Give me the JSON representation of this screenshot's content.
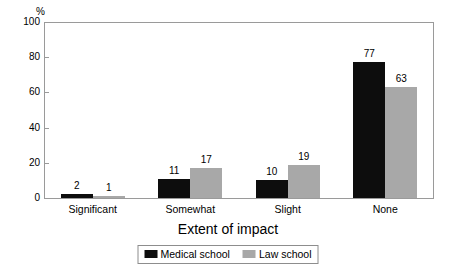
{
  "chart_data": {
    "type": "bar",
    "title": "",
    "subtitle": "",
    "xlabel": "Extent of impact",
    "ylabel": "%",
    "ylim": [
      0,
      100
    ],
    "yticks": [
      0,
      20,
      40,
      60,
      80,
      100
    ],
    "ytick_labels": [
      "0",
      "20",
      "40",
      "60",
      "80",
      "100"
    ],
    "grid": false,
    "legend_position": "bottom-center",
    "categories": [
      "Significant",
      "Somewhat",
      "Slight",
      "None"
    ],
    "series": [
      {
        "name": "Medical school",
        "color": "#0d0d0d",
        "values": [
          2,
          11,
          10,
          77
        ],
        "value_labels": [
          "2",
          "11",
          "10",
          "77"
        ]
      },
      {
        "name": "Law school",
        "color": "#a8a8a8",
        "values": [
          1,
          17,
          19,
          63
        ],
        "value_labels": [
          "1",
          "17",
          "19",
          "63"
        ]
      }
    ]
  },
  "axis": {
    "y_unit_label": "%",
    "x_title": "Extent of impact"
  },
  "legend": {
    "items": [
      {
        "label": "Medical school",
        "swatch": "medical-swatch"
      },
      {
        "label": "Law school",
        "swatch": "law-swatch"
      }
    ]
  }
}
